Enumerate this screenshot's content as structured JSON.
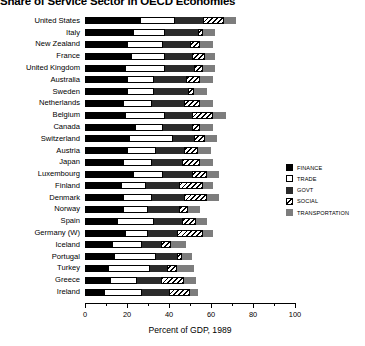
{
  "chart_data": {
    "type": "bar",
    "orientation": "horizontal",
    "stacked": true,
    "title": "Share of Service Sector in OECD Economies",
    "xlabel": "Percent of GDP, 1989",
    "ylabel": "",
    "xlim": [
      0,
      100
    ],
    "xticks": [
      0,
      20,
      40,
      60,
      80,
      100
    ],
    "xticklabels": [
      "0",
      "20",
      "40",
      "60",
      "80",
      "100"
    ],
    "grid": false,
    "legend_position": "right",
    "categories": [
      "United States",
      "Italy",
      "New Zealand",
      "France",
      "United Kingdom",
      "Australia",
      "Sweden",
      "Netherlands",
      "Belgium",
      "Canada",
      "Switzerland",
      "Austria",
      "Japan",
      "Luxembourg",
      "Finland",
      "Denmark",
      "Norway",
      "Spain",
      "Germany (W)",
      "Iceland",
      "Portugal",
      "Turkey",
      "Greece",
      "Ireland"
    ],
    "series": [
      {
        "name": "FINANCE",
        "color": "#000000",
        "values": [
          26,
          23,
          20,
          22,
          19,
          20,
          20,
          18,
          19,
          24,
          21,
          20,
          18,
          23,
          17,
          18,
          18,
          15,
          19,
          13,
          14,
          11,
          12,
          9
        ]
      },
      {
        "name": "TRADE",
        "color": "#ffffff",
        "values": [
          17,
          15,
          17,
          16,
          19,
          13,
          13,
          14,
          19,
          13,
          21,
          14,
          14,
          14,
          12,
          14,
          12,
          18,
          11,
          14,
          20,
          20,
          13,
          18
        ]
      },
      {
        "name": "GOVT",
        "color": "#2b2b2b",
        "values": [
          13,
          16,
          13,
          13,
          14,
          15,
          16,
          15,
          13,
          14,
          10,
          13,
          14,
          14,
          16,
          15,
          15,
          13,
          14,
          9,
          10,
          8,
          11,
          13
        ]
      },
      {
        "name": "SOCIAL",
        "color": "#ffffff",
        "hatch": "//",
        "values": [
          10,
          2,
          5,
          6,
          4,
          7,
          3,
          8,
          10,
          4,
          5,
          7,
          9,
          7,
          11,
          11,
          4,
          7,
          12,
          5,
          2,
          5,
          11,
          10
        ]
      },
      {
        "name": "TRANSPORTATION",
        "color": "#7d7d7d",
        "values": [
          6,
          6,
          6,
          5,
          6,
          6,
          6,
          6,
          6,
          6,
          6,
          6,
          6,
          6,
          5,
          6,
          6,
          5,
          5,
          7,
          5,
          8,
          6,
          4
        ]
      }
    ]
  },
  "legend": {
    "items": [
      {
        "label": "FINANCE"
      },
      {
        "label": "TRADE"
      },
      {
        "label": "GOVT"
      },
      {
        "label": "SOCIAL"
      },
      {
        "label": "TRANSPORTATION"
      }
    ]
  }
}
